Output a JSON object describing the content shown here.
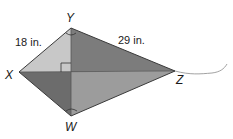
{
  "diagram": {
    "type": "kite",
    "vertices": {
      "X": {
        "label": "X",
        "x": 19,
        "y": 72
      },
      "Y": {
        "label": "Y",
        "x": 71,
        "y": 28
      },
      "Z": {
        "label": "Z",
        "x": 175,
        "y": 71
      },
      "W": {
        "label": "W",
        "x": 71,
        "y": 116
      }
    },
    "measurements": {
      "XY": "18 in.",
      "YZ": "29 in."
    },
    "marks": [
      "right-angle at diagonal intersection",
      "angle arc at Y",
      "angle arc at W"
    ],
    "colors": {
      "face_XYO": "#c6c6c6",
      "face_YZO": "#7a7a7a",
      "face_XWO": "#6e6e6e",
      "face_WZO": "#9a9a9a",
      "edge": "#3a3a3a",
      "string": "#8a8a8a"
    }
  }
}
